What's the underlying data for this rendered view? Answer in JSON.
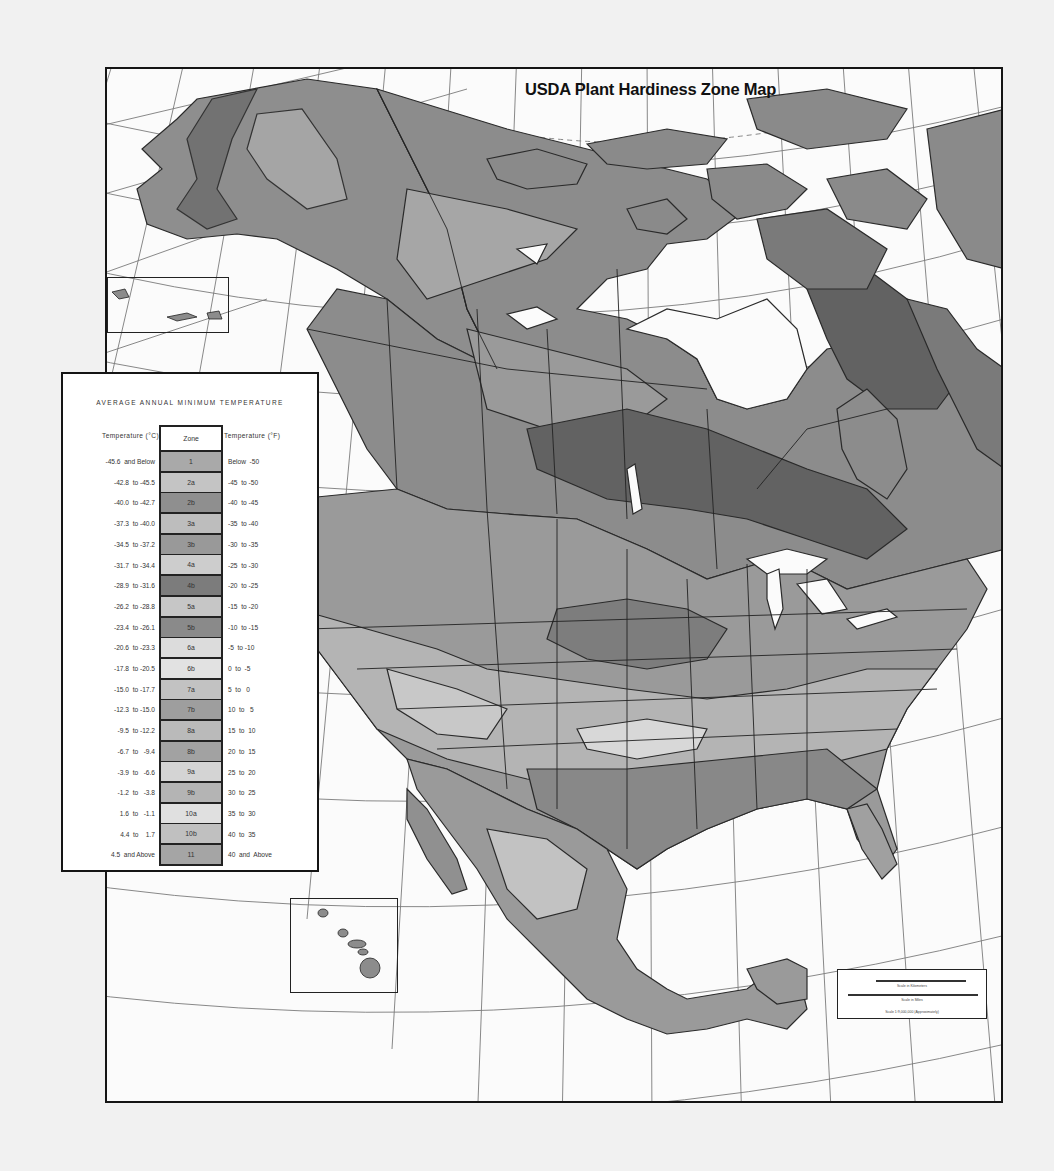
{
  "map": {
    "title": "USDA Plant Hardiness Zone Map",
    "colors": {
      "background": "#f1f1f1",
      "map_paper": "#fbfbfb",
      "frame": "#151515",
      "water": "#ffffff",
      "graticule": "#6a6a6a",
      "zone_darkest": "#555555",
      "zone_dark": "#707070",
      "zone_mid": "#8e8e8e",
      "zone_light": "#b0b0b0",
      "zone_lighter": "#c8c8c8",
      "zone_lightest": "#dedede"
    },
    "insets": [
      "Aleutian Islands inset",
      "Hawaii inset"
    ]
  },
  "legend": {
    "title": "AVERAGE ANNUAL MINIMUM TEMPERATURE",
    "header_c": "Temperature (°C)",
    "header_zone": "Zone",
    "header_f": "Temperature (°F)",
    "rows": [
      {
        "c": "-45.6  and Below",
        "zone": "1",
        "f": "Below  -50",
        "color": "#a9a9a9"
      },
      {
        "c": "-42.8  to -45.5",
        "zone": "2a",
        "f": "-45  to -50",
        "color": "#c4c4c4"
      },
      {
        "c": "-40.0  to -42.7",
        "zone": "2b",
        "f": "-40  to -45",
        "color": "#8f8f8f"
      },
      {
        "c": "-37.3  to -40.0",
        "zone": "3a",
        "f": "-35  to -40",
        "color": "#bdbdbd"
      },
      {
        "c": "-34.5  to -37.2",
        "zone": "3b",
        "f": "-30  to -35",
        "color": "#999999"
      },
      {
        "c": "-31.7  to -34.4",
        "zone": "4a",
        "f": "-25  to -30",
        "color": "#cdcdcd"
      },
      {
        "c": "-28.9  to -31.6",
        "zone": "4b",
        "f": "-20  to -25",
        "color": "#7c7c7c"
      },
      {
        "c": "-26.2  to -28.8",
        "zone": "5a",
        "f": "-15  to -20",
        "color": "#c6c6c6"
      },
      {
        "c": "-23.4  to -26.1",
        "zone": "5b",
        "f": "-10  to -15",
        "color": "#8a8a8a"
      },
      {
        "c": "-20.6  to -23.3",
        "zone": "6a",
        "f": "-5  to -10",
        "color": "#dcdcdc"
      },
      {
        "c": "-17.8  to -20.5",
        "zone": "6b",
        "f": "0  to  -5",
        "color": "#e2e2e2"
      },
      {
        "c": "-15.0  to -17.7",
        "zone": "7a",
        "f": "5  to   0",
        "color": "#c2c2c2"
      },
      {
        "c": "-12.3  to -15.0",
        "zone": "7b",
        "f": "10  to   5",
        "color": "#9e9e9e"
      },
      {
        "c": "-9.5  to -12.2",
        "zone": "8a",
        "f": "15  to  10",
        "color": "#bababa"
      },
      {
        "c": "-6.7  to   -9.4",
        "zone": "8b",
        "f": "20  to  15",
        "color": "#a2a2a2"
      },
      {
        "c": "-3.9  to   -6.6",
        "zone": "9a",
        "f": "25  to  20",
        "color": "#d4d4d4"
      },
      {
        "c": "-1.2  to   -3.8",
        "zone": "9b",
        "f": "30  to  25",
        "color": "#b4b4b4"
      },
      {
        "c": "1.6  to   -1.1",
        "zone": "10a",
        "f": "35  to  30",
        "color": "#e0e0e0"
      },
      {
        "c": "4.4  to    1.7",
        "zone": "10b",
        "f": "40  to  35",
        "color": "#c0c0c0"
      },
      {
        "c": "4.5  and Above",
        "zone": "11",
        "f": "40  and  Above",
        "color": "#a5a5a5"
      }
    ]
  },
  "scale": {
    "km_label": "Scale in Kilometers",
    "mi_label": "Scale in Miles",
    "ratio_label": "Scale 1:9,000,000 (Approximately)"
  }
}
